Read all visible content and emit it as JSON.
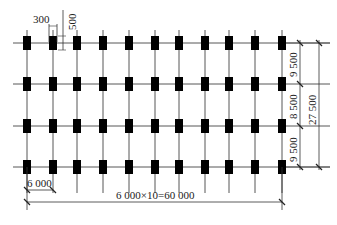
{
  "diagram": {
    "columns_x": [
      27,
      53,
      77,
      103,
      129,
      155,
      179,
      205,
      229,
      255,
      282
    ],
    "rows_y": [
      43,
      84,
      126,
      167
    ],
    "grid_line": {
      "x_start": 13,
      "x_end": 330,
      "color": "#444444"
    },
    "column_block": {
      "width": 8,
      "height": 14,
      "color": "#000000"
    },
    "vertical_line": {
      "y_top": 30,
      "y_bottom": 193
    }
  },
  "dimensions": {
    "column_width": "300",
    "column_depth": "500",
    "bay_spacing": "6 000",
    "total_length": "6 000×10=60 000",
    "row_spacing": [
      "9 500",
      "8 500",
      "9 500"
    ],
    "total_width": "27 500"
  }
}
